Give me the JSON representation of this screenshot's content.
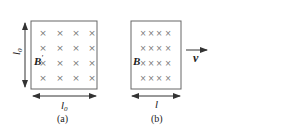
{
  "figure": {
    "panel_a": {
      "caption": "(a)",
      "field_label": "B",
      "field_prime": "′",
      "width_label": "l",
      "width_sub": "0",
      "height_label": "l",
      "height_sub": "0",
      "cross_rows": 4,
      "cross_cols": 4,
      "cross_glyph": "×"
    },
    "panel_b": {
      "caption": "(b)",
      "field_label": "B",
      "width_label": "l",
      "velocity_label": "v",
      "cross_rows": 4,
      "cross_cols": 4,
      "cross_glyph": "×"
    },
    "colors": {
      "line": "#666666",
      "arrow": "#333333",
      "cross": "#777777"
    }
  }
}
